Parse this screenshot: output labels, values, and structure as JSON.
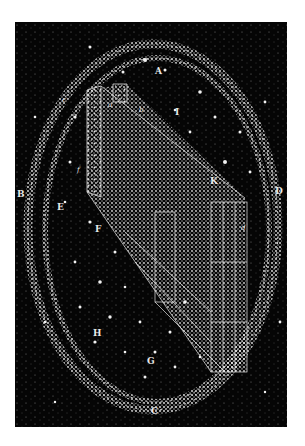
{
  "figure": {
    "background_color": "#050505",
    "star_color": "#f0f0f0",
    "labels": {
      "A": "A",
      "a": "a",
      "b": "b",
      "c": "c",
      "I": "I",
      "B": "B",
      "E": "E",
      "f": "f",
      "K": "K",
      "D": "D",
      "F": "F",
      "d": "d",
      "H": "H",
      "G": "G",
      "C": "C"
    }
  }
}
